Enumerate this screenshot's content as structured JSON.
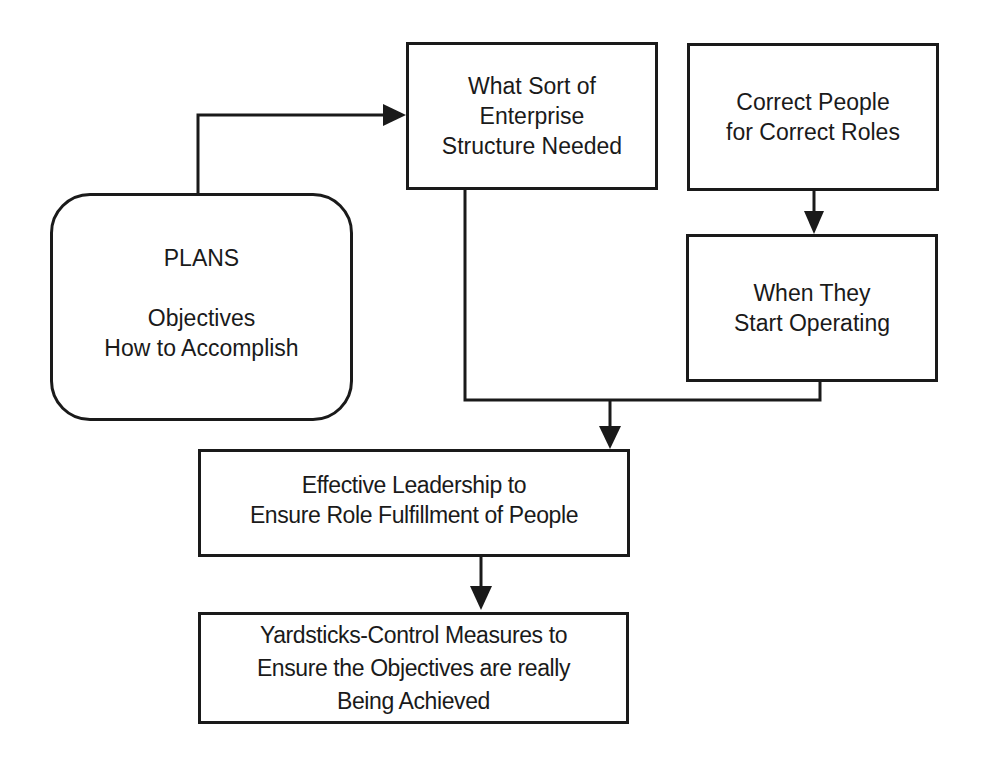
{
  "diagram": {
    "nodes": {
      "plans": {
        "title": "PLANS",
        "lines": [
          "Objectives",
          "How to Accomplish"
        ]
      },
      "structure": {
        "lines": [
          "What Sort of",
          "Enterprise",
          "Structure Needed"
        ]
      },
      "people": {
        "lines": [
          "Correct People",
          "for Correct Roles"
        ]
      },
      "operating": {
        "lines": [
          "When They",
          "Start Operating"
        ]
      },
      "leadership": {
        "lines": [
          "Effective Leadership to",
          "Ensure Role Fulfillment of People"
        ]
      },
      "yardsticks": {
        "lines": [
          "Yardsticks-Control Measures to",
          "Ensure the Objectives are really",
          "Being Achieved"
        ]
      }
    },
    "edges": [
      {
        "from": "plans",
        "to": "structure",
        "arrow": true
      },
      {
        "from": "people",
        "to": "operating",
        "arrow": true
      },
      {
        "from": "structure",
        "to": "leadership",
        "arrow": true,
        "merged_with": "operating"
      },
      {
        "from": "operating",
        "to": "leadership",
        "arrow": true,
        "merged_with": "structure"
      },
      {
        "from": "leadership",
        "to": "yardsticks",
        "arrow": true
      }
    ],
    "colors": {
      "stroke": "#1a1a1a",
      "background": "#ffffff"
    }
  }
}
